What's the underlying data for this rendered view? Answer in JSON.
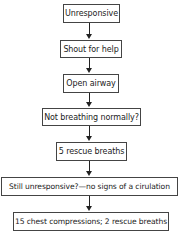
{
  "flowchart": {
    "nodes": [
      {
        "label": "Unresponsive"
      },
      {
        "label": "Shout for help"
      },
      {
        "label": "Open airway"
      },
      {
        "label": "Not breathing normally?"
      },
      {
        "label": "5 rescue breaths"
      },
      {
        "label": "Still unresponsive?—no signs of a cirulation"
      },
      {
        "label": "15 chest compressions; 2 rescue breaths"
      }
    ],
    "colors": {
      "border": "#444444",
      "arrow": "#222222",
      "text": "#222222",
      "background": "#ffffff"
    }
  }
}
